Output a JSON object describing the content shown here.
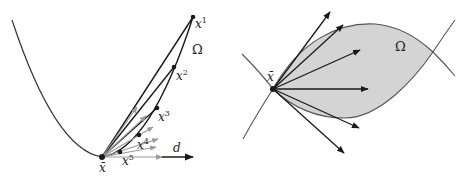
{
  "left_panel": {
    "labels": {
      "x1": "x",
      "x1_sup": "1",
      "x2": "x",
      "x2_sup": "2",
      "x3": "x",
      "x3_sup": "3",
      "x4": "x",
      "x4_sup": "4",
      "x5": "x",
      "x5_sup": "5",
      "xbar": "x̄",
      "d": "d",
      "omega": "Ω"
    }
  },
  "right_panel": {
    "labels": {
      "xbar": "x̄",
      "omega": "Ω"
    }
  },
  "colors": {
    "stroke": "#1a1a1a",
    "gray_arrow": "#9a9a9a",
    "region_fill": "#d4d4d4",
    "region_stroke": "#555555"
  }
}
